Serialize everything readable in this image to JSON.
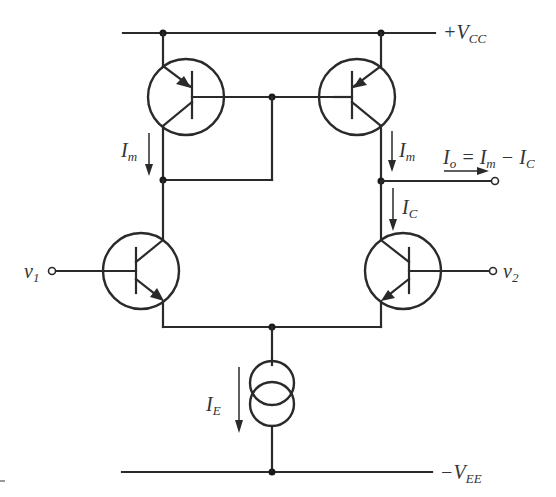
{
  "diagram": {
    "supply_labels": {
      "vcc": "+V",
      "vcc_sub": "CC",
      "vee": "−V",
      "vee_sub": "EE"
    },
    "inputs": {
      "v1": "v",
      "v1_sub": "1",
      "v2": "v",
      "v2_sub": "2"
    },
    "currents": {
      "im_left": "I",
      "im_left_sub": "m",
      "im_right": "I",
      "im_right_sub": "m",
      "ic": "I",
      "ic_sub": "C",
      "ie": "I",
      "ie_sub": "E",
      "io_expr_pre": "I",
      "io_sub": "o",
      "io_expr_eq": " = I",
      "io_m_sub": "m",
      "io_expr_minus": " − I",
      "io_c_sub": "C"
    },
    "components": [
      {
        "id": "Q3",
        "type": "PNP",
        "role": "current-mirror diode-connected"
      },
      {
        "id": "Q4",
        "type": "PNP",
        "role": "current-mirror output"
      },
      {
        "id": "Q1",
        "type": "NPN",
        "role": "differential pair input v1"
      },
      {
        "id": "Q2",
        "type": "NPN",
        "role": "differential pair input v2"
      },
      {
        "id": "IE",
        "type": "current-source",
        "role": "tail current"
      }
    ],
    "colors": {
      "wire": "#2a2a2a",
      "background": "#ffffff",
      "text": "#333333"
    }
  }
}
